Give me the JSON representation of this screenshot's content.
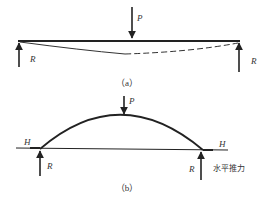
{
  "figure_a": {
    "caption": "（a）",
    "load_label": "P",
    "reaction_left_label": "R",
    "reaction_right_label": "R",
    "description": "simply supported beam with central point load P, deflected shape shown dashed"
  },
  "figure_b": {
    "caption": "（b）",
    "load_label": "P",
    "reaction_left_label": "R",
    "reaction_right_label": "R",
    "thrust_left_label": "H",
    "thrust_right_label": "H",
    "thrust_note": "水平推力",
    "description": "arch with central point load P, vertical reactions R and horizontal thrusts H"
  },
  "colors": {
    "ink": "#222222",
    "background": "#ffffff"
  }
}
